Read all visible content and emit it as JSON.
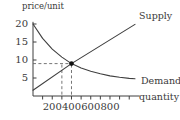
{
  "figure": {
    "y_axis_title": "price/unit",
    "x_axis_title": "quantity",
    "supply_label": "Supply",
    "demand_label": "Demand"
  },
  "chart_data": {
    "type": "line",
    "title": "",
    "xlabel": "quantity",
    "ylabel": "price/unit",
    "xlim": [
      0,
      1110
    ],
    "ylim": [
      0,
      20.6
    ],
    "x_major_ticks": [
      200,
      400,
      600,
      800
    ],
    "x_minor_ticks": [
      100,
      200,
      300,
      400,
      500,
      600,
      700,
      800,
      900,
      1000
    ],
    "y_ticks": [
      20,
      15,
      10,
      5
    ],
    "grid": false,
    "legend_position": "inline-labels",
    "axis_color": "#3f3f3f",
    "line_color": "#3f3f3f",
    "dashed_guide_color": "#666666",
    "point_color": "#111111",
    "equilibrium": {
      "quantity": 400,
      "price": 9
    },
    "dashed_guides": {
      "price": 9,
      "quantities": [
        300,
        400
      ]
    },
    "series": [
      {
        "name": "Supply",
        "points": [
          [
            0,
            1.6
          ],
          [
            400,
            9
          ],
          [
            1060,
            19.9
          ]
        ]
      },
      {
        "name": "Demand",
        "points": [
          [
            0,
            20
          ],
          [
            100,
            16.0
          ],
          [
            200,
            13.0
          ],
          [
            300,
            10.8
          ],
          [
            400,
            9.0
          ],
          [
            500,
            7.8
          ],
          [
            600,
            6.9
          ],
          [
            700,
            6.2
          ],
          [
            800,
            5.6
          ],
          [
            900,
            5.2
          ],
          [
            1000,
            4.9
          ],
          [
            1060,
            4.8
          ]
        ]
      }
    ]
  }
}
